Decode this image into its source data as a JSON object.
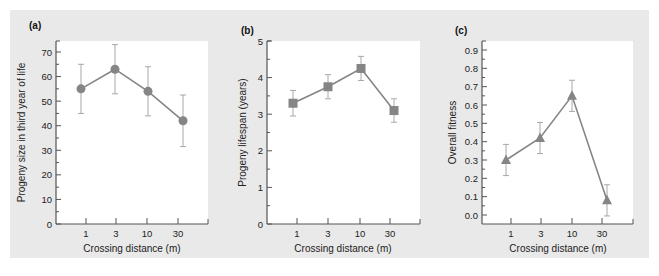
{
  "figure": {
    "background_color": "#e9e9e9",
    "plot_color": "#ffffff",
    "series_color": "#858585",
    "errorbar_color": "#a8a8a8"
  },
  "chart_data": [
    {
      "panel_label": "(a)",
      "type": "line",
      "marker": "circle",
      "title": "",
      "xlabel": "Crossing distance (m)",
      "ylabel": "Progeny size in third year of life",
      "categories": [
        "1",
        "3",
        "10",
        "30"
      ],
      "values": [
        55,
        63,
        54,
        42
      ],
      "error": [
        10,
        10,
        10,
        10.5
      ],
      "ylim": [
        0,
        75
      ],
      "yticks": [
        0,
        10,
        20,
        30,
        40,
        50,
        60,
        70
      ],
      "ytick_labels": [
        "0",
        "10",
        "20",
        "30",
        "40",
        "50",
        "60",
        "70"
      ],
      "grid": false
    },
    {
      "panel_label": "(b)",
      "type": "line",
      "marker": "square",
      "title": "",
      "xlabel": "Crossing distance (m)",
      "ylabel": "Progeny lifespan (years)",
      "categories": [
        "1",
        "3",
        "10",
        "30"
      ],
      "values": [
        3.3,
        3.75,
        4.25,
        3.1
      ],
      "error": [
        0.35,
        0.33,
        0.33,
        0.32
      ],
      "ylim": [
        0,
        5
      ],
      "yticks": [
        0,
        1,
        2,
        3,
        4,
        5
      ],
      "ytick_labels": [
        "0",
        "1",
        "2",
        "3",
        "4",
        "5"
      ],
      "grid": false
    },
    {
      "panel_label": "(c)",
      "type": "line",
      "marker": "triangle",
      "title": "",
      "xlabel": "Crossing distance (m)",
      "ylabel": "Overall fitness",
      "categories": [
        "1",
        "3",
        "10",
        "30"
      ],
      "values": [
        0.3,
        0.42,
        0.65,
        0.08
      ],
      "error": [
        0.085,
        0.085,
        0.085,
        0.085
      ],
      "ylim": [
        0.0,
        0.9
      ],
      "yticks": [
        0.0,
        0.1,
        0.2,
        0.3,
        0.4,
        0.5,
        0.6,
        0.7,
        0.8,
        0.9
      ],
      "ytick_labels": [
        "0.0",
        "0.1",
        "0.2",
        "0.3",
        "0.4",
        "0.5",
        "0.6",
        "0.7",
        "0.8",
        "0.9"
      ],
      "grid": false
    }
  ]
}
